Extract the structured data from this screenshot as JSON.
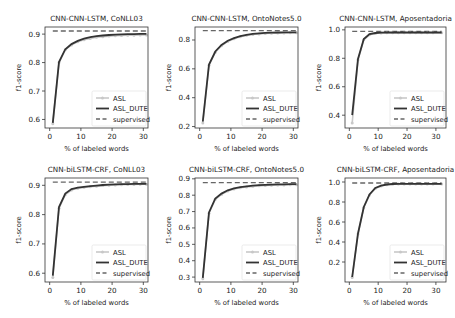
{
  "figure": {
    "width": 455,
    "height": 318,
    "colors": {
      "asl": "#c8c8c8",
      "asl_dute": "#333333",
      "supervised": "#666666",
      "frame": "#333333"
    }
  },
  "chart_data": [
    {
      "type": "line",
      "title": "CNN-CNN-LSTM, CoNLL03",
      "xlabel": "% of labeled words",
      "ylabel": "f1-score",
      "xlim": [
        -1.5,
        31.5
      ],
      "ylim": [
        0.57,
        0.925
      ],
      "xticks": [
        0,
        10,
        20,
        30
      ],
      "yticks": [
        0.6,
        0.7,
        0.8,
        0.9
      ],
      "ytick_labels": [
        "0.6",
        "0.7",
        "0.8",
        "0.9"
      ],
      "legend_position": "lower right",
      "x": [
        1,
        3,
        5,
        7,
        9,
        11,
        13,
        15,
        17,
        19,
        21,
        23,
        25,
        27,
        29,
        31
      ],
      "series": [
        {
          "name": "ASL",
          "style": "light gray line with markers",
          "values": [
            0.585,
            0.8,
            0.845,
            0.862,
            0.873,
            0.88,
            0.885,
            0.889,
            0.891,
            0.893,
            0.894,
            0.895,
            0.896,
            0.896,
            0.897,
            0.897
          ]
        },
        {
          "name": "ASL_DUTE",
          "style": "dark solid line",
          "values": [
            0.588,
            0.802,
            0.847,
            0.865,
            0.876,
            0.884,
            0.889,
            0.893,
            0.895,
            0.897,
            0.898,
            0.899,
            0.9,
            0.9,
            0.901,
            0.901
          ]
        },
        {
          "name": "supervised",
          "style": "dashed line",
          "values": [
            0.911,
            0.911,
            0.911,
            0.911,
            0.911,
            0.911,
            0.911,
            0.911,
            0.911,
            0.911,
            0.911,
            0.911,
            0.911,
            0.911,
            0.911,
            0.911
          ]
        }
      ]
    },
    {
      "type": "line",
      "title": "CNN-CNN-LSTM, OntoNotes5.0",
      "xlabel": "% of labeled words",
      "ylabel": "f1-score",
      "xlim": [
        -1.5,
        31.5
      ],
      "ylim": [
        0.19,
        0.89
      ],
      "xticks": [
        0,
        10,
        20,
        30
      ],
      "yticks": [
        0.2,
        0.4,
        0.6,
        0.8
      ],
      "ytick_labels": [
        "0.2",
        "0.4",
        "0.6",
        "0.8"
      ],
      "legend_position": "lower right",
      "x": [
        1,
        3,
        5,
        7,
        9,
        11,
        13,
        15,
        17,
        19,
        21,
        23,
        25,
        27,
        29,
        31
      ],
      "series": [
        {
          "name": "ASL",
          "style": "light gray line with markers",
          "values": [
            0.225,
            0.625,
            0.715,
            0.76,
            0.79,
            0.808,
            0.822,
            0.832,
            0.838,
            0.842,
            0.845,
            0.847,
            0.848,
            0.849,
            0.85,
            0.85
          ]
        },
        {
          "name": "ASL_DUTE",
          "style": "dark solid line",
          "values": [
            0.235,
            0.63,
            0.72,
            0.765,
            0.795,
            0.813,
            0.827,
            0.836,
            0.842,
            0.846,
            0.849,
            0.851,
            0.852,
            0.853,
            0.853,
            0.853
          ]
        },
        {
          "name": "supervised",
          "style": "dashed line",
          "values": [
            0.865,
            0.865,
            0.865,
            0.865,
            0.865,
            0.865,
            0.865,
            0.865,
            0.865,
            0.865,
            0.865,
            0.865,
            0.865,
            0.865,
            0.865,
            0.865
          ]
        }
      ]
    },
    {
      "type": "line",
      "title": "CNN-CNN-LSTM, Aposentadoria",
      "xlabel": "% of labeled words",
      "ylabel": "f1-score",
      "xlim": [
        -1.5,
        33.5
      ],
      "ylim": [
        0.31,
        1.02
      ],
      "xticks": [
        0,
        10,
        20,
        30
      ],
      "yticks": [
        0.4,
        0.6,
        0.8,
        1.0
      ],
      "ytick_labels": [
        "0.4",
        "0.6",
        "0.8",
        "1.0"
      ],
      "legend_position": "lower right",
      "x": [
        1,
        3,
        5,
        7,
        9,
        11,
        13,
        15,
        17,
        19,
        21,
        23,
        25,
        27,
        29,
        32
      ],
      "series": [
        {
          "name": "ASL",
          "style": "light gray line with markers",
          "values": [
            0.345,
            0.79,
            0.93,
            0.965,
            0.975,
            0.978,
            0.979,
            0.98,
            0.98,
            0.98,
            0.98,
            0.98,
            0.98,
            0.98,
            0.98,
            0.98
          ]
        },
        {
          "name": "ASL_DUTE",
          "style": "dark solid line",
          "values": [
            0.4,
            0.795,
            0.935,
            0.97,
            0.978,
            0.98,
            0.981,
            0.981,
            0.981,
            0.981,
            0.981,
            0.981,
            0.981,
            0.981,
            0.981,
            0.981
          ]
        },
        {
          "name": "supervised",
          "style": "dashed line",
          "values": [
            0.99,
            0.99,
            0.99,
            0.99,
            0.99,
            0.99,
            0.99,
            0.99,
            0.99,
            0.99,
            0.99,
            0.99,
            0.99,
            0.99,
            0.99,
            0.99
          ]
        }
      ]
    },
    {
      "type": "line",
      "title": "CNN-biLSTM-CRF, CoNLL03",
      "xlabel": "% of labeled words",
      "ylabel": "f1-score",
      "xlim": [
        -1.5,
        31.5
      ],
      "ylim": [
        0.57,
        0.925
      ],
      "xticks": [
        0,
        10,
        20,
        30
      ],
      "yticks": [
        0.6,
        0.7,
        0.8,
        0.9
      ],
      "ytick_labels": [
        "0.6",
        "0.7",
        "0.8",
        "0.9"
      ],
      "legend_position": "lower right",
      "x": [
        1,
        3,
        5,
        7,
        9,
        11,
        13,
        15,
        17,
        19,
        21,
        23,
        25,
        27,
        29,
        31
      ],
      "series": [
        {
          "name": "ASL",
          "style": "light gray line with markers",
          "values": [
            0.585,
            0.822,
            0.868,
            0.884,
            0.89,
            0.893,
            0.895,
            0.897,
            0.899,
            0.9,
            0.901,
            0.902,
            0.903,
            0.903,
            0.904,
            0.904
          ]
        },
        {
          "name": "ASL_DUTE",
          "style": "dark solid line",
          "values": [
            0.592,
            0.826,
            0.872,
            0.887,
            0.892,
            0.895,
            0.897,
            0.899,
            0.901,
            0.902,
            0.903,
            0.904,
            0.904,
            0.905,
            0.905,
            0.905
          ]
        },
        {
          "name": "supervised",
          "style": "dashed line",
          "values": [
            0.911,
            0.911,
            0.911,
            0.911,
            0.911,
            0.911,
            0.911,
            0.911,
            0.911,
            0.911,
            0.911,
            0.911,
            0.911,
            0.911,
            0.911,
            0.911
          ]
        }
      ]
    },
    {
      "type": "line",
      "title": "CNN-biLSTM-CRF, OntoNotes5.0",
      "xlabel": "% of labeled words",
      "ylabel": "f1-score",
      "xlim": [
        -1.5,
        31.5
      ],
      "ylim": [
        0.27,
        0.905
      ],
      "xticks": [
        0,
        10,
        20,
        30
      ],
      "yticks": [
        0.3,
        0.4,
        0.5,
        0.6,
        0.7,
        0.8,
        0.9
      ],
      "ytick_labels": [
        "0.3",
        "0.4",
        "0.5",
        "0.6",
        "0.7",
        "0.8",
        "0.9"
      ],
      "legend_position": "lower right",
      "x": [
        1,
        3,
        5,
        7,
        9,
        11,
        13,
        15,
        17,
        19,
        21,
        23,
        25,
        27,
        29,
        31
      ],
      "series": [
        {
          "name": "ASL",
          "style": "light gray line with markers",
          "values": [
            0.29,
            0.69,
            0.775,
            0.805,
            0.825,
            0.838,
            0.845,
            0.85,
            0.854,
            0.857,
            0.859,
            0.861,
            0.862,
            0.863,
            0.864,
            0.864
          ]
        },
        {
          "name": "ASL_DUTE",
          "style": "dark solid line",
          "values": [
            0.295,
            0.695,
            0.78,
            0.81,
            0.83,
            0.842,
            0.849,
            0.854,
            0.858,
            0.861,
            0.863,
            0.865,
            0.866,
            0.866,
            0.867,
            0.867
          ]
        },
        {
          "name": "supervised",
          "style": "dashed line",
          "values": [
            0.876,
            0.876,
            0.876,
            0.876,
            0.876,
            0.876,
            0.876,
            0.876,
            0.876,
            0.876,
            0.876,
            0.876,
            0.876,
            0.876,
            0.876,
            0.876
          ]
        }
      ]
    },
    {
      "type": "line",
      "title": "CNN-biLSTM-CRF, Aposentadoria",
      "xlabel": "% of labeled words",
      "ylabel": "f1-score",
      "xlim": [
        -1.5,
        33.5
      ],
      "ylim": [
        0.0,
        1.04
      ],
      "xticks": [
        0,
        10,
        20,
        30
      ],
      "yticks": [
        0.2,
        0.4,
        0.6,
        0.8,
        1.0
      ],
      "ytick_labels": [
        "0.2",
        "0.4",
        "0.6",
        "0.8",
        "1.0"
      ],
      "legend_position": "lower right",
      "x": [
        1,
        3,
        5,
        7,
        9,
        11,
        13,
        15,
        17,
        19,
        21,
        23,
        25,
        27,
        29,
        32
      ],
      "series": [
        {
          "name": "ASL",
          "style": "light gray line with markers",
          "values": [
            0.045,
            0.48,
            0.745,
            0.87,
            0.935,
            0.96,
            0.972,
            0.978,
            0.98,
            0.98,
            0.981,
            0.981,
            0.981,
            0.981,
            0.981,
            0.981
          ]
        },
        {
          "name": "ASL_DUTE",
          "style": "dark solid line",
          "values": [
            0.05,
            0.485,
            0.75,
            0.875,
            0.94,
            0.963,
            0.975,
            0.98,
            0.982,
            0.982,
            0.982,
            0.982,
            0.982,
            0.982,
            0.982,
            0.982
          ]
        },
        {
          "name": "supervised",
          "style": "dashed line",
          "values": [
            0.99,
            0.99,
            0.99,
            0.99,
            0.99,
            0.99,
            0.99,
            0.99,
            0.99,
            0.99,
            0.99,
            0.99,
            0.99,
            0.99,
            0.99,
            0.99
          ]
        }
      ]
    }
  ],
  "legend": {
    "items": [
      "ASL",
      "ASL_DUTE",
      "supervised"
    ]
  }
}
